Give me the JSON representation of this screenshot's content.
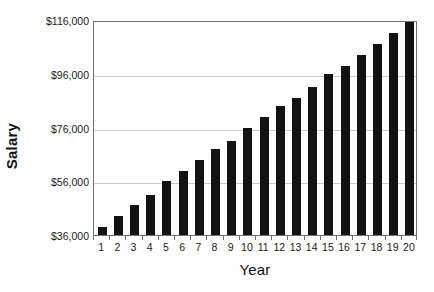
{
  "chart_data": {
    "type": "bar",
    "title": "",
    "xlabel": "Year",
    "ylabel": "Salary",
    "categories": [
      "1",
      "2",
      "3",
      "4",
      "5",
      "6",
      "7",
      "8",
      "9",
      "10",
      "11",
      "12",
      "13",
      "14",
      "15",
      "16",
      "17",
      "18",
      "19",
      "20"
    ],
    "values": [
      39000,
      43000,
      47000,
      51000,
      56000,
      60000,
      64000,
      68000,
      71000,
      76000,
      80000,
      84000,
      87000,
      91000,
      96000,
      99000,
      103000,
      107000,
      111000,
      116000
    ],
    "ylim": [
      36000,
      116000
    ],
    "ytick_values": [
      36000,
      56000,
      76000,
      96000,
      116000
    ],
    "ytick_labels": [
      "$36,000",
      "$56,000",
      "$76,000",
      "$96,000",
      "$116,000"
    ],
    "grid": true,
    "grid_axis": "y",
    "legend": false,
    "legend_position": "none",
    "bar_color": "#121212",
    "gridline_color": "#c9c9c9",
    "frame_color": "#6f6f6f",
    "background_color": "#ffffff"
  }
}
